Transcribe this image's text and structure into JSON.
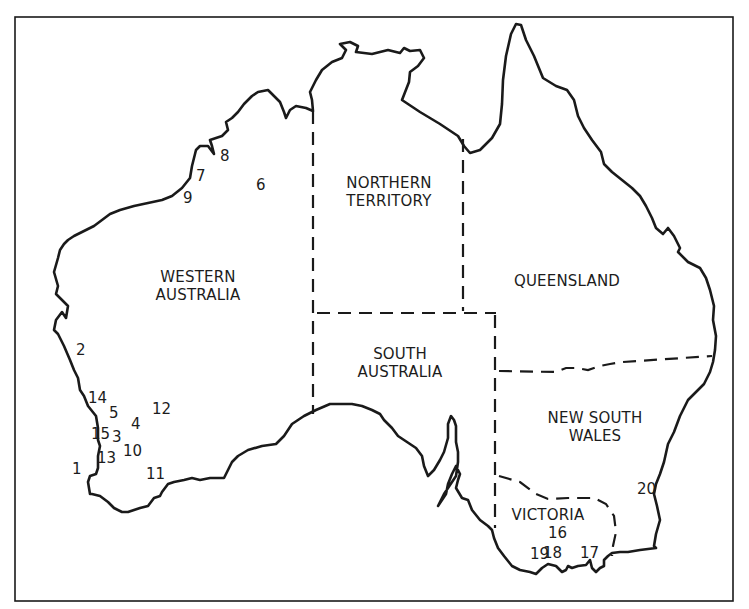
{
  "map": {
    "colors": {
      "line": "#1a1a1a",
      "background": "#ffffff",
      "text": "#1c1c1c"
    },
    "states": [
      {
        "id": "wa",
        "lines": [
          "WESTERN",
          "AUSTRALIA"
        ]
      },
      {
        "id": "nt",
        "lines": [
          "NORTHERN",
          "TERRITORY"
        ]
      },
      {
        "id": "qld",
        "lines": [
          "QUEENSLAND"
        ]
      },
      {
        "id": "sa",
        "lines": [
          "SOUTH",
          "AUSTRALIA"
        ]
      },
      {
        "id": "nsw",
        "lines": [
          "NEW SOUTH",
          "WALES"
        ]
      },
      {
        "id": "vic",
        "lines": [
          "VICTORIA"
        ]
      }
    ],
    "markers": [
      {
        "label": "1",
        "x": 72,
        "y": 469
      },
      {
        "label": "2",
        "x": 76,
        "y": 350
      },
      {
        "label": "3",
        "x": 112,
        "y": 437
      },
      {
        "label": "4",
        "x": 131,
        "y": 424
      },
      {
        "label": "5",
        "x": 109,
        "y": 413
      },
      {
        "label": "6",
        "x": 256,
        "y": 185
      },
      {
        "label": "7",
        "x": 196,
        "y": 176
      },
      {
        "label": "8",
        "x": 220,
        "y": 156
      },
      {
        "label": "9",
        "x": 183,
        "y": 198
      },
      {
        "label": "10",
        "x": 123,
        "y": 451
      },
      {
        "label": "11",
        "x": 146,
        "y": 474
      },
      {
        "label": "12",
        "x": 152,
        "y": 409
      },
      {
        "label": "13",
        "x": 97,
        "y": 458
      },
      {
        "label": "14",
        "x": 88,
        "y": 398
      },
      {
        "label": "15",
        "x": 91,
        "y": 434
      },
      {
        "label": "16",
        "x": 548,
        "y": 533
      },
      {
        "label": "17",
        "x": 580,
        "y": 553
      },
      {
        "label": "18",
        "x": 543,
        "y": 553
      },
      {
        "label": "19",
        "x": 530,
        "y": 554
      },
      {
        "label": "20",
        "x": 637,
        "y": 489
      }
    ]
  }
}
